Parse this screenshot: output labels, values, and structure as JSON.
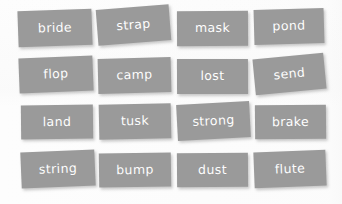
{
  "board": {
    "name": "word-card-board",
    "background_color": "#fdfdfd",
    "card_color": "#9a9a9a",
    "text_color": "#ffffff",
    "rows": 4,
    "columns": 4,
    "card_count": 16
  },
  "cards": [
    {
      "label": "bride",
      "row": 1,
      "col": 1,
      "x": 18,
      "y": 10,
      "w": 74,
      "h": 36,
      "rotation": -2.0
    },
    {
      "label": "strap",
      "row": 1,
      "col": 2,
      "x": 97,
      "y": 7,
      "w": 73,
      "h": 36,
      "rotation": -4.5
    },
    {
      "label": "mask",
      "row": 1,
      "col": 3,
      "x": 177,
      "y": 11,
      "w": 71,
      "h": 35,
      "rotation": -0.3
    },
    {
      "label": "pond",
      "row": 1,
      "col": 4,
      "x": 254,
      "y": 9,
      "w": 70,
      "h": 35,
      "rotation": -1.6
    },
    {
      "label": "flop",
      "row": 2,
      "col": 1,
      "x": 19,
      "y": 57,
      "w": 74,
      "h": 35,
      "rotation": -2.2
    },
    {
      "label": "camp",
      "row": 2,
      "col": 2,
      "x": 98,
      "y": 58,
      "w": 73,
      "h": 35,
      "rotation": -1.4
    },
    {
      "label": "lost",
      "row": 2,
      "col": 3,
      "x": 177,
      "y": 59,
      "w": 71,
      "h": 35,
      "rotation": -0.2
    },
    {
      "label": "send",
      "row": 2,
      "col": 4,
      "x": 254,
      "y": 56,
      "w": 71,
      "h": 36,
      "rotation": -5.5
    },
    {
      "label": "land",
      "row": 3,
      "col": 1,
      "x": 21,
      "y": 105,
      "w": 72,
      "h": 34,
      "rotation": -0.6
    },
    {
      "label": "tusk",
      "row": 3,
      "col": 2,
      "x": 99,
      "y": 104,
      "w": 72,
      "h": 35,
      "rotation": -1.2
    },
    {
      "label": "strong",
      "row": 3,
      "col": 3,
      "x": 177,
      "y": 103,
      "w": 73,
      "h": 36,
      "rotation": -3.0
    },
    {
      "label": "brake",
      "row": 3,
      "col": 4,
      "x": 255,
      "y": 105,
      "w": 71,
      "h": 34,
      "rotation": -0.5
    },
    {
      "label": "string",
      "row": 4,
      "col": 1,
      "x": 21,
      "y": 151,
      "w": 74,
      "h": 36,
      "rotation": -2.4
    },
    {
      "label": "bump",
      "row": 4,
      "col": 2,
      "x": 99,
      "y": 153,
      "w": 72,
      "h": 34,
      "rotation": -0.8
    },
    {
      "label": "dust",
      "row": 4,
      "col": 3,
      "x": 177,
      "y": 153,
      "w": 71,
      "h": 34,
      "rotation": -0.4
    },
    {
      "label": "flute",
      "row": 4,
      "col": 4,
      "x": 254,
      "y": 151,
      "w": 72,
      "h": 36,
      "rotation": -2.2
    }
  ]
}
